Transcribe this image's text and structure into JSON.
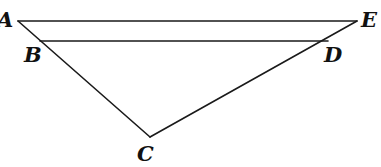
{
  "figure": {
    "kind": "geometry-diagram",
    "canvas": {
      "width": 381,
      "height": 167,
      "background": "#ffffff"
    },
    "style": {
      "stroke_color": "#1a1a1a",
      "stroke_width": 1.6,
      "label_color": "#111111",
      "label_font_size": 21,
      "label_weight": "bold",
      "label_style": "italic"
    },
    "points": [
      {
        "name": "A",
        "label": "A",
        "x": 18,
        "y": 21,
        "label_x": -3,
        "label_y": 9
      },
      {
        "name": "B",
        "label": "B",
        "x": 40,
        "y": 41,
        "label_x": 24,
        "label_y": 44
      },
      {
        "name": "C",
        "label": "C",
        "x": 150,
        "y": 137,
        "label_x": 137,
        "label_y": 143
      },
      {
        "name": "D",
        "label": "D",
        "x": 328,
        "y": 41,
        "label_x": 324,
        "label_y": 44
      },
      {
        "name": "E",
        "label": "E",
        "x": 357,
        "y": 21,
        "label_x": 361,
        "label_y": 9
      }
    ],
    "segments": [
      {
        "name": "AE",
        "from": "A",
        "to": "E",
        "x1": 18,
        "y1": 21,
        "x2": 357,
        "y2": 21
      },
      {
        "name": "BD",
        "from": "B",
        "to": "D",
        "x1": 40,
        "y1": 41,
        "x2": 328,
        "y2": 41
      },
      {
        "name": "AC",
        "from": "A",
        "to": "C",
        "x1": 18,
        "y1": 21,
        "x2": 150,
        "y2": 137
      },
      {
        "name": "CE",
        "from": "C",
        "to": "E",
        "x1": 150,
        "y1": 137,
        "x2": 357,
        "y2": 21
      }
    ]
  }
}
